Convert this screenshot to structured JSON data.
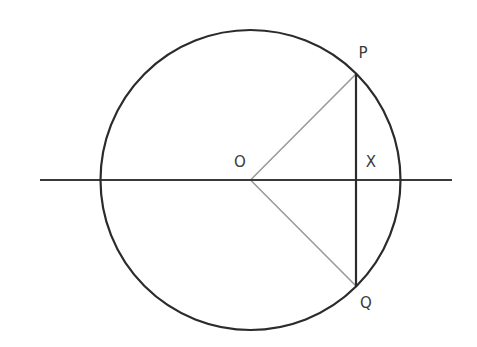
{
  "figure": {
    "kind": "geometry-diagram",
    "background_color": "#ffffff",
    "width": 477,
    "height": 347
  },
  "style": {
    "circle_stroke": "#2b2b2b",
    "circle_stroke_width": 2.2,
    "axis_stroke": "#3a3a3a",
    "axis_stroke_width": 2.2,
    "chord_stroke": "#2b2b2b",
    "chord_stroke_width": 2.2,
    "radius_stroke": "#9a9a9a",
    "radius_stroke_width": 1.6,
    "label_color": "#3a3a3a",
    "label_font_size": "15px"
  },
  "geometry": {
    "circle": {
      "name": "main-circle",
      "center_x": 250.5,
      "center_y": 180,
      "radius": 150
    },
    "horizontal_axis": {
      "name": "horizontal-diameter-line",
      "x1": 40,
      "y1": 180,
      "x2": 452,
      "y2": 180
    },
    "chord_pq": {
      "name": "chord-p-q",
      "x1": 356,
      "y1": 74,
      "x2": 356,
      "y2": 286
    },
    "radius_op": {
      "name": "radius-o-p",
      "x1": 250.5,
      "y1": 180,
      "x2": 356,
      "y2": 74
    },
    "radius_oq": {
      "name": "radius-o-q",
      "x1": 250.5,
      "y1": 180,
      "x2": 356,
      "y2": 286
    }
  },
  "labels": {
    "p": {
      "text": "P",
      "x": 363,
      "y": 53
    },
    "x": {
      "text": "X",
      "x": 371,
      "y": 162
    },
    "o": {
      "text": "O",
      "x": 240,
      "y": 162
    },
    "q": {
      "text": "Q",
      "x": 366,
      "y": 303
    }
  }
}
